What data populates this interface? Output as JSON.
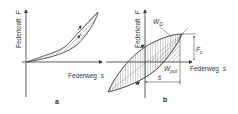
{
  "diagram_a": {
    "y_axis_label": "Federkraft",
    "y_axis_symbol": "F",
    "x_axis_label": "Federweg",
    "x_axis_symbol": "s",
    "caption": "a"
  },
  "diagram_b": {
    "y_axis_label": "Federkraft",
    "y_axis_symbol": "F",
    "x_axis_label": "Federweg",
    "x_axis_symbol": "s",
    "label_wd": "W",
    "label_wd_sub": "D",
    "label_wpot": "W",
    "label_wpot_sub": "pot",
    "label_fc": "F",
    "label_fc_sub": "c",
    "label_s_hat": "ŝ",
    "caption": "b"
  }
}
